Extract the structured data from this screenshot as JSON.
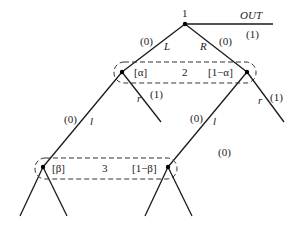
{
  "diagram": {
    "type": "extensive-form game tree",
    "nodes": {
      "root": {
        "player": "1",
        "x": 185,
        "y": 24
      },
      "p2_left": {
        "belief": "[α]",
        "x": 122,
        "y": 72
      },
      "p2_right": {
        "belief": "[1−α]",
        "x": 247,
        "y": 72
      },
      "p3_left": {
        "belief": "[β]",
        "x": 43,
        "y": 167
      },
      "p3_right": {
        "belief": "[1−β]",
        "x": 168,
        "y": 167
      }
    },
    "info_sets": {
      "player2": {
        "label": "2"
      },
      "player3": {
        "label": "3"
      }
    },
    "edges": {
      "out": {
        "action": "OUT",
        "payoff": "(1)"
      },
      "L": {
        "action": "L",
        "payoff": "(0)"
      },
      "R": {
        "action": "R",
        "payoff": "(0)"
      },
      "left_r": {
        "action": "r",
        "payoff": "(1)"
      },
      "right_r": {
        "action": "r",
        "payoff": "(1)"
      },
      "left_l": {
        "action": "l",
        "payoff": "(0)"
      },
      "right_l": {
        "action": "l",
        "payoff": "(0)"
      }
    },
    "extra_payoff": "(0)"
  }
}
